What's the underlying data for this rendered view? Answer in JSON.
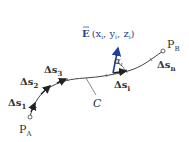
{
  "diagram": {
    "type": "line-integral-path",
    "colors": {
      "curve": "#444444",
      "arrow": "#222222",
      "vector": "#1f3e9e",
      "label": "#333333",
      "vector_label": "#2a3f8f"
    },
    "start_point": {
      "label": "P",
      "sub": "A"
    },
    "end_point": {
      "label": "P",
      "sub": "B"
    },
    "curve_label": "C",
    "segments": [
      {
        "label": "Δs",
        "sub": "1"
      },
      {
        "label": "Δs",
        "sub": "2"
      },
      {
        "label": "Δs",
        "sub": "3"
      },
      {
        "label": "Δs",
        "sub": "i"
      },
      {
        "label": "Δs",
        "sub": "n"
      }
    ],
    "field_vector": {
      "label": "E",
      "args_open": "(x",
      "sub_x": "i",
      "comma1": ", y",
      "sub_y": "i",
      "comma2": ", z",
      "sub_z": "i",
      "args_close": ")"
    },
    "angle": {
      "label": "α",
      "sub": "i"
    }
  }
}
